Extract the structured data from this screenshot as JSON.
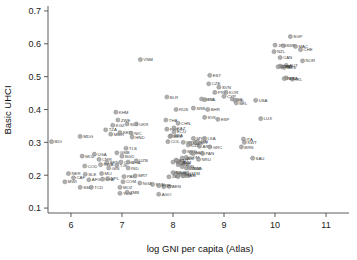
{
  "chart_data": {
    "type": "scatter",
    "title": "",
    "xlabel": "log GNI per capita (Atlas)",
    "ylabel": "Basic UHCI",
    "xlim": [
      5.55,
      11.45
    ],
    "ylim": [
      0.085,
      0.715
    ],
    "xticks": [
      6,
      7,
      8,
      9,
      10,
      11
    ],
    "xtick_labels": [
      "6",
      "7",
      "8",
      "9",
      "10",
      "11"
    ],
    "yticks": [
      0.1,
      0.2,
      0.3,
      0.4,
      0.5,
      0.6,
      0.7
    ],
    "ytick_labels": [
      "0.1",
      "0.2",
      "0.3",
      "0.4",
      "0.5",
      "0.6",
      "0.7"
    ],
    "grid": false,
    "legend": "none",
    "marker_color": "#9a9a9a",
    "label_color": "#3d3d3d",
    "point_label_field": "iso3",
    "points": [
      {
        "iso3": "BDI",
        "x": 5.62,
        "y": 0.302
      },
      {
        "iso3": "MDG",
        "x": 6.18,
        "y": 0.318
      },
      {
        "iso3": "MOZ",
        "x": 6.22,
        "y": 0.258
      },
      {
        "iso3": "UGA",
        "x": 6.46,
        "y": 0.264
      },
      {
        "iso3": "CMR",
        "x": 6.55,
        "y": 0.248
      },
      {
        "iso3": "COD",
        "x": 6.27,
        "y": 0.228
      },
      {
        "iso3": "BEN",
        "x": 6.7,
        "y": 0.238
      },
      {
        "iso3": "RWA",
        "x": 6.58,
        "y": 0.232
      },
      {
        "iso3": "GIN",
        "x": 6.74,
        "y": 0.222
      },
      {
        "iso3": "TJK",
        "x": 6.9,
        "y": 0.23
      },
      {
        "iso3": "NER",
        "x": 5.95,
        "y": 0.205
      },
      {
        "iso3": "SLE",
        "x": 6.28,
        "y": 0.203
      },
      {
        "iso3": "MLI",
        "x": 6.6,
        "y": 0.205
      },
      {
        "iso3": "CAF",
        "x": 6.05,
        "y": 0.192
      },
      {
        "iso3": "AFG",
        "x": 6.35,
        "y": 0.186
      },
      {
        "iso3": "BFA",
        "x": 6.62,
        "y": 0.188
      },
      {
        "iso3": "NPL",
        "x": 6.72,
        "y": 0.19
      },
      {
        "iso3": "MWI",
        "x": 5.88,
        "y": 0.18
      },
      {
        "iso3": "SSD",
        "x": 6.18,
        "y": 0.163
      },
      {
        "iso3": "TCD",
        "x": 6.4,
        "y": 0.163
      },
      {
        "iso3": "KGZ",
        "x": 6.82,
        "y": 0.352
      },
      {
        "iso3": "ZWE",
        "x": 6.92,
        "y": 0.368
      },
      {
        "iso3": "KHM",
        "x": 6.88,
        "y": 0.392
      },
      {
        "iso3": "TZA",
        "x": 6.68,
        "y": 0.338
      },
      {
        "iso3": "MMR",
        "x": 6.78,
        "y": 0.325
      },
      {
        "iso3": "KEN",
        "x": 6.96,
        "y": 0.33
      },
      {
        "iso3": "SLB",
        "x": 7.1,
        "y": 0.356
      },
      {
        "iso3": "UKR",
        "x": 7.28,
        "y": 0.356
      },
      {
        "iso3": "NIC",
        "x": 7.18,
        "y": 0.328
      },
      {
        "iso3": "HND",
        "x": 7.2,
        "y": 0.316
      },
      {
        "iso3": "TLS",
        "x": 7.08,
        "y": 0.282
      },
      {
        "iso3": "GMB",
        "x": 6.9,
        "y": 0.268
      },
      {
        "iso3": "BGD",
        "x": 7.0,
        "y": 0.258
      },
      {
        "iso3": "COG",
        "x": 6.98,
        "y": 0.24
      },
      {
        "iso3": "GHA",
        "x": 7.12,
        "y": 0.24
      },
      {
        "iso3": "UZB",
        "x": 7.28,
        "y": 0.244
      },
      {
        "iso3": "IND",
        "x": 7.12,
        "y": 0.222
      },
      {
        "iso3": "PAK",
        "x": 7.04,
        "y": 0.196
      },
      {
        "iso3": "MRT",
        "x": 7.26,
        "y": 0.198
      },
      {
        "iso3": "COM",
        "x": 7.02,
        "y": 0.18
      },
      {
        "iso3": "NGA",
        "x": 7.35,
        "y": 0.176
      },
      {
        "iso3": "MOZ2",
        "x": 6.96,
        "y": 0.163
      },
      {
        "iso3": "YEM",
        "x": 6.96,
        "y": 0.145
      },
      {
        "iso3": "ZMB",
        "x": 7.1,
        "y": 0.148
      },
      {
        "iso3": "SDN",
        "x": 7.6,
        "y": 0.172
      },
      {
        "iso3": "AGO",
        "x": 7.72,
        "y": 0.142
      },
      {
        "iso3": "CIV",
        "x": 7.82,
        "y": 0.165
      },
      {
        "iso3": "SEN",
        "x": 7.92,
        "y": 0.166
      },
      {
        "iso3": "ETH",
        "x": 7.72,
        "y": 0.168
      },
      {
        "iso3": "ZAF",
        "x": 7.92,
        "y": 0.195
      },
      {
        "iso3": "VNM",
        "x": 7.36,
        "y": 0.552
      },
      {
        "iso3": "BLR",
        "x": 7.88,
        "y": 0.438
      },
      {
        "iso3": "RUS",
        "x": 8.06,
        "y": 0.4
      },
      {
        "iso3": "THA",
        "x": 7.86,
        "y": 0.368
      },
      {
        "iso3": "CHN",
        "x": 8.1,
        "y": 0.358
      },
      {
        "iso3": "PER",
        "x": 7.88,
        "y": 0.34
      },
      {
        "iso3": "KAZ",
        "x": 8.02,
        "y": 0.344
      },
      {
        "iso3": "ECU",
        "x": 8.02,
        "y": 0.332
      },
      {
        "iso3": "BRA",
        "x": 7.96,
        "y": 0.32
      },
      {
        "iso3": "MEX",
        "x": 7.94,
        "y": 0.318
      },
      {
        "iso3": "COL",
        "x": 7.9,
        "y": 0.302
      },
      {
        "iso3": "PRY",
        "x": 8.2,
        "y": 0.3
      },
      {
        "iso3": "MYS",
        "x": 8.4,
        "y": 0.312
      },
      {
        "iso3": "MAR",
        "x": 8.34,
        "y": 0.296
      },
      {
        "iso3": "DZA",
        "x": 8.3,
        "y": 0.292
      },
      {
        "iso3": "ARG",
        "x": 8.52,
        "y": 0.288
      },
      {
        "iso3": "TUR",
        "x": 8.44,
        "y": 0.3
      },
      {
        "iso3": "IRN",
        "x": 8.48,
        "y": 0.302
      },
      {
        "iso3": "LKA",
        "x": 8.62,
        "y": 0.312
      },
      {
        "iso3": "GRC",
        "x": 8.72,
        "y": 0.286
      },
      {
        "iso3": "MKD",
        "x": 8.22,
        "y": 0.272
      },
      {
        "iso3": "BGR",
        "x": 8.36,
        "y": 0.268
      },
      {
        "iso3": "PHL",
        "x": 8.4,
        "y": 0.266
      },
      {
        "iso3": "PAN",
        "x": 8.58,
        "y": 0.266
      },
      {
        "iso3": "DOM",
        "x": 8.26,
        "y": 0.254
      },
      {
        "iso3": "NRU",
        "x": 8.5,
        "y": 0.248
      },
      {
        "iso3": "JAM",
        "x": 8.18,
        "y": 0.252
      },
      {
        "iso3": "FSM",
        "x": 8.12,
        "y": 0.238
      },
      {
        "iso3": "MDA",
        "x": 8.0,
        "y": 0.24
      },
      {
        "iso3": "VUT",
        "x": 8.08,
        "y": 0.244
      },
      {
        "iso3": "FJI",
        "x": 8.06,
        "y": 0.246
      },
      {
        "iso3": "BIH",
        "x": 8.14,
        "y": 0.236
      },
      {
        "iso3": "ALB",
        "x": 8.1,
        "y": 0.232
      },
      {
        "iso3": "TON",
        "x": 8.18,
        "y": 0.226
      },
      {
        "iso3": "WSM",
        "x": 8.26,
        "y": 0.222
      },
      {
        "iso3": "BWA",
        "x": 8.32,
        "y": 0.222
      },
      {
        "iso3": "GTM",
        "x": 8.28,
        "y": 0.206
      },
      {
        "iso3": "SLV",
        "x": 8.22,
        "y": 0.204
      },
      {
        "iso3": "BOL",
        "x": 8.06,
        "y": 0.206
      },
      {
        "iso3": "MNG",
        "x": 8.0,
        "y": 0.208
      },
      {
        "iso3": "IDN",
        "x": 8.04,
        "y": 0.202
      },
      {
        "iso3": "SWZ",
        "x": 8.1,
        "y": 0.196
      },
      {
        "iso3": "NAM",
        "x": 8.2,
        "y": 0.198
      },
      {
        "iso3": "EST",
        "x": 8.72,
        "y": 0.504
      },
      {
        "iso3": "CZE",
        "x": 8.7,
        "y": 0.478
      },
      {
        "iso3": "SVN",
        "x": 8.9,
        "y": 0.468
      },
      {
        "iso3": "PRT",
        "x": 8.82,
        "y": 0.452
      },
      {
        "iso3": "KOR",
        "x": 9.04,
        "y": 0.452
      },
      {
        "iso3": "HRV",
        "x": 8.56,
        "y": 0.432
      },
      {
        "iso3": "LVA",
        "x": 8.62,
        "y": 0.43
      },
      {
        "iso3": "CYP",
        "x": 9.0,
        "y": 0.44
      },
      {
        "iso3": "ISR",
        "x": 9.16,
        "y": 0.432
      },
      {
        "iso3": "SRB",
        "x": 8.4,
        "y": 0.404
      },
      {
        "iso3": "BHR",
        "x": 8.68,
        "y": 0.4
      },
      {
        "iso3": "SVK",
        "x": 8.62,
        "y": 0.376
      },
      {
        "iso3": "ESP",
        "x": 8.88,
        "y": 0.37
      },
      {
        "iso3": "ISL",
        "x": 9.22,
        "y": 0.428
      },
      {
        "iso3": "BEL",
        "x": 9.24,
        "y": 0.42
      },
      {
        "iso3": "USA",
        "x": 9.62,
        "y": 0.428
      },
      {
        "iso3": "LUX",
        "x": 9.72,
        "y": 0.372
      },
      {
        "iso3": "ITA",
        "x": 9.38,
        "y": 0.31
      },
      {
        "iso3": "KWT",
        "x": 9.4,
        "y": 0.3
      },
      {
        "iso3": "BRN",
        "x": 9.34,
        "y": 0.286
      },
      {
        "iso3": "SAU",
        "x": 9.56,
        "y": 0.252
      },
      {
        "iso3": "SGP",
        "x": 10.3,
        "y": 0.622
      },
      {
        "iso3": "JPN",
        "x": 10.0,
        "y": 0.596
      },
      {
        "iso3": "SWE",
        "x": 10.16,
        "y": 0.594
      },
      {
        "iso3": "MAC",
        "x": 10.4,
        "y": 0.592
      },
      {
        "iso3": "CHE",
        "x": 10.5,
        "y": 0.582
      },
      {
        "iso3": "NZL",
        "x": 9.98,
        "y": 0.576
      },
      {
        "iso3": "CAN",
        "x": 10.1,
        "y": 0.558
      },
      {
        "iso3": "NOR",
        "x": 10.54,
        "y": 0.548
      },
      {
        "iso3": "AUT",
        "x": 10.22,
        "y": 0.534
      },
      {
        "iso3": "DEU",
        "x": 10.1,
        "y": 0.532
      },
      {
        "iso3": "FIN",
        "x": 10.14,
        "y": 0.53
      },
      {
        "iso3": "AUS",
        "x": 10.18,
        "y": 0.528
      },
      {
        "iso3": "GBR",
        "x": 10.06,
        "y": 0.53
      },
      {
        "iso3": "IRL",
        "x": 10.34,
        "y": 0.492
      },
      {
        "iso3": "FRA",
        "x": 10.22,
        "y": 0.496
      },
      {
        "iso3": "NLD",
        "x": 10.18,
        "y": 0.494
      }
    ]
  }
}
